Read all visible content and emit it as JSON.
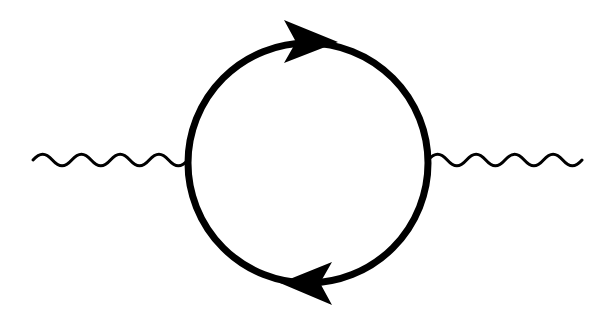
{
  "diagram": {
    "background": "#ffffff",
    "line_color": "#000000",
    "loop": {
      "type": "fermion-loop",
      "center": [
        308,
        163
      ],
      "radius": 120,
      "stroke_width": 7,
      "arrows": [
        {
          "position": "top",
          "direction": "right",
          "tip": [
            338,
            42
          ]
        },
        {
          "position": "bottom",
          "direction": "left",
          "tip": [
            280,
            283
          ]
        }
      ]
    },
    "propagators": [
      {
        "type": "photon-wavy",
        "side": "left",
        "x_start": 33,
        "x_end": 188,
        "y": 160,
        "periods": 4,
        "amplitude": 6,
        "stroke_width": 3
      },
      {
        "type": "photon-wavy",
        "side": "right",
        "x_start": 428,
        "x_end": 582,
        "y": 160,
        "periods": 4,
        "amplitude": 6,
        "stroke_width": 3
      }
    ]
  }
}
